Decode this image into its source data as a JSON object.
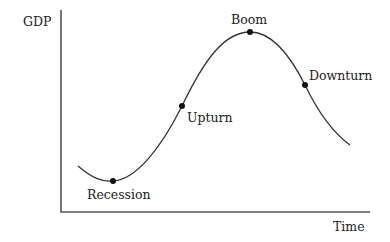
{
  "diagram": {
    "y_axis_label": "GDP",
    "x_axis_label": "Time",
    "colors": {
      "axis": "#555555",
      "curve": "#333333",
      "point": "#111111",
      "text": "#222222"
    },
    "phases": [
      {
        "label": "Recession",
        "x": 113,
        "y": 181
      },
      {
        "label": "Upturn",
        "x": 182,
        "y": 106
      },
      {
        "label": "Boom",
        "x": 250,
        "y": 32
      },
      {
        "label": "Downturn",
        "x": 305,
        "y": 85
      }
    ]
  }
}
